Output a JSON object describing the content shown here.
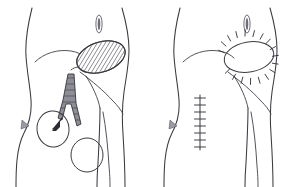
{
  "figure": {
    "background_color": "#ffffff",
    "ink_color": "#3a3a42",
    "width": 296,
    "height": 187,
    "panel_count": 2
  },
  "panels": [
    {
      "id": "left-panel",
      "label": "Preoperative marking panel",
      "description": "Lower torso and hip showing hatched donor-site ellipse, surgical forceps, pointer arrow and two outlined lesions",
      "origin_x": 0,
      "annotations": [
        {
          "name": "hatched-graft-ellipse",
          "label": "Hatched graft ellipse",
          "shape": "ellipse",
          "cx": 101,
          "cy": 57,
          "rx": 25,
          "ry": 15,
          "rotation": -18,
          "fill_pattern": "diagonal-hatch",
          "hatch_count": 17,
          "stroke": "#3a3a42"
        },
        {
          "name": "surgical-forceps",
          "label": "Surgical forceps instrument",
          "shape": "instrument",
          "fill": "#8d8d95",
          "stroke": "#2e2e36",
          "hatch_count": 9
        },
        {
          "name": "pointer-arrow",
          "label": "Pointer arrow to lesion",
          "shape": "arrow",
          "stroke": "#2b2b33",
          "target": "upper-lesion-circle"
        },
        {
          "name": "upper-lesion-circle",
          "label": "Upper lesion outline",
          "shape": "ellipse",
          "cx": 53,
          "cy": 129,
          "rx": 16,
          "ry": 18,
          "rotation": -6,
          "stroke": "#3a3a42"
        },
        {
          "name": "lower-lesion-circle",
          "label": "Lower lesion outline",
          "shape": "ellipse",
          "cx": 87,
          "cy": 155,
          "rx": 16,
          "ry": 17,
          "rotation": 0,
          "stroke": "#3a3a42"
        },
        {
          "name": "umbilicus",
          "label": "Umbilicus",
          "shape": "vertical-oval",
          "cx": 99,
          "cy": 24
        },
        {
          "name": "flank-shading-mark",
          "label": "Flank shading mark",
          "shape": "triangle",
          "fill": "#9a9aa2"
        }
      ]
    },
    {
      "id": "right-panel",
      "label": "Postoperative result panel",
      "description": "Same lower torso showing the sutured elliptical wound and a vertical sutured incision line",
      "origin_x": 148,
      "annotations": [
        {
          "name": "sutured-ellipse-wound",
          "label": "Sutured elliptical wound",
          "shape": "ellipse",
          "cx": 249,
          "cy": 57,
          "rx": 25,
          "ry": 15,
          "rotation": -10,
          "stitch_count": 18,
          "stroke": "#2e2e36"
        },
        {
          "name": "vertical-suture-line",
          "label": "Vertical sutured incision",
          "shape": "line",
          "x": 200,
          "y_start": 95,
          "y_end": 150,
          "stitch_count": 8,
          "stitch_width": 11,
          "stroke": "#2e2e36"
        },
        {
          "name": "umbilicus",
          "label": "Umbilicus",
          "shape": "vertical-oval",
          "cx": 247,
          "cy": 24
        },
        {
          "name": "flank-shading-mark",
          "label": "Flank shading mark",
          "shape": "triangle",
          "fill": "#9a9aa2"
        }
      ]
    }
  ]
}
